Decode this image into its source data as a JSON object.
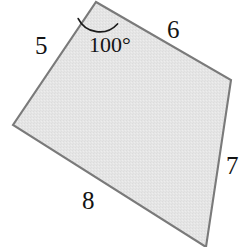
{
  "figure": {
    "type": "quadrilateral-diagram",
    "fill_color": "#e4e4e4",
    "stroke_color": "#7a7a7a",
    "text_color": "#141414",
    "background_color": "#ffffff",
    "canvas": {
      "width": 249,
      "height": 247
    },
    "vertices": [
      {
        "name": "top-apex",
        "x": 96,
        "y": 2
      },
      {
        "name": "right",
        "x": 231,
        "y": 80
      },
      {
        "name": "bottom-right",
        "x": 206,
        "y": 247
      },
      {
        "name": "left",
        "x": 13,
        "y": 125
      }
    ],
    "polygon_points": "96,2 231,80 206,247 13,125",
    "angle_arc": {
      "vertex": "top-apex",
      "path": "M 78.2,18.6 A 24 24 0 0 0 117.5,24.0",
      "radius": 24
    },
    "sides": [
      {
        "id": "side-5",
        "label": "5",
        "between": [
          "top-apex",
          "left"
        ]
      },
      {
        "id": "side-6",
        "label": "6",
        "between": [
          "top-apex",
          "right"
        ]
      },
      {
        "id": "side-7",
        "label": "7",
        "between": [
          "right",
          "bottom-right"
        ]
      },
      {
        "id": "side-8",
        "label": "8",
        "between": [
          "left",
          "bottom-right"
        ]
      }
    ],
    "angles": [
      {
        "id": "angle-100",
        "label": "100°",
        "at": "top-apex"
      }
    ]
  }
}
